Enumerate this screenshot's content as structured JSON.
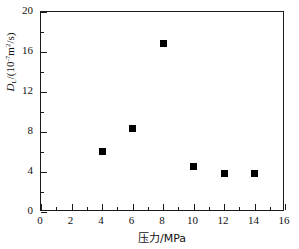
{
  "chart_data": {
    "type": "scatter",
    "title": "",
    "xlabel": "压力/MPa",
    "ylabel_parts": {
      "symbol": "D",
      "subscript": "L",
      "unit_prefix": "/(10",
      "exponent": "-7",
      "unit_suffix_m": "m",
      "unit_sup_2": "2",
      "unit_tail": "/s)"
    },
    "ylabel": "DL/(10-7m2/s)",
    "xlim": [
      0,
      16
    ],
    "ylim": [
      0,
      20
    ],
    "xticks": [
      0,
      2,
      4,
      6,
      8,
      10,
      12,
      14,
      16
    ],
    "xtick_labels": [
      "0",
      "2",
      "4",
      "6",
      "8",
      "10",
      "12",
      "14",
      "16"
    ],
    "x_minor_ticks": [
      1,
      3,
      5,
      7,
      9,
      11,
      13,
      15
    ],
    "yticks": [
      0,
      4,
      8,
      12,
      16,
      20
    ],
    "ytick_labels": [
      "0",
      "4",
      "8",
      "12",
      "16",
      "20"
    ],
    "y_minor_ticks": [
      2,
      6,
      10,
      14,
      18
    ],
    "grid": false,
    "legend": null,
    "marker": "square",
    "marker_color": "#000000",
    "x": [
      4,
      6,
      8,
      10,
      12,
      14
    ],
    "values": [
      6.1,
      8.4,
      16.9,
      4.6,
      3.9,
      3.9
    ],
    "points": [
      {
        "x": 4,
        "y": 6.1
      },
      {
        "x": 6,
        "y": 8.4
      },
      {
        "x": 8,
        "y": 16.9
      },
      {
        "x": 10,
        "y": 4.6
      },
      {
        "x": 12,
        "y": 3.9
      },
      {
        "x": 14,
        "y": 3.9
      }
    ]
  }
}
